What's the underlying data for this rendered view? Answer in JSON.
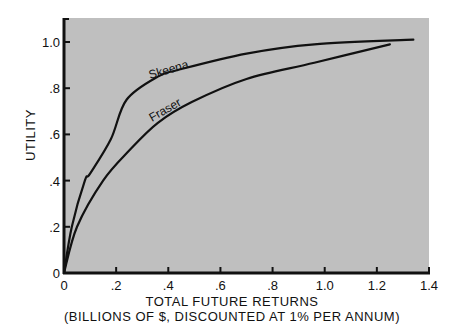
{
  "chart_data": {
    "type": "line",
    "title": "",
    "xlabel": "TOTAL FUTURE RETURNS",
    "xlabel_sub": "(BILLIONS OF $, DISCOUNTED AT 1% PER ANNUM)",
    "ylabel": "UTILITY",
    "xlim": [
      0,
      1.4
    ],
    "ylim": [
      0,
      1.1
    ],
    "x_ticks": [
      0,
      0.2,
      0.4,
      0.6,
      0.8,
      1.0,
      1.2,
      1.4
    ],
    "x_tick_labels": [
      "0",
      ".2",
      ".4",
      ".6",
      ".8",
      "1.0",
      "1.2",
      "1.4"
    ],
    "y_ticks": [
      0,
      0.2,
      0.4,
      0.6,
      0.8,
      1.0
    ],
    "y_tick_labels": [
      "0",
      ".2",
      ".4",
      ".6",
      ".8",
      "1.0"
    ],
    "grid": false,
    "legend": "inline labels on curves",
    "background": "#bfbfbf",
    "line_color": "#111111",
    "series": [
      {
        "name": "Skeena",
        "x": [
          0,
          0.03,
          0.08,
          0.1,
          0.18,
          0.24,
          0.36,
          0.44,
          0.7,
          0.96,
          1.34
        ],
        "y": [
          0,
          0.2,
          0.4,
          0.43,
          0.58,
          0.75,
          0.85,
          0.88,
          0.95,
          0.99,
          1.01
        ]
      },
      {
        "name": "Fraser",
        "x": [
          0,
          0.05,
          0.15,
          0.25,
          0.36,
          0.49,
          0.7,
          0.96,
          1.25
        ],
        "y": [
          0,
          0.2,
          0.4,
          0.53,
          0.65,
          0.74,
          0.84,
          0.91,
          0.99
        ]
      }
    ]
  }
}
